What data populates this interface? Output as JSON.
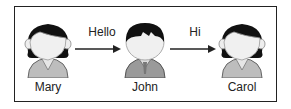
{
  "diagram": {
    "nodes": [
      {
        "id": "mary",
        "label": "Mary",
        "type": "female-person"
      },
      {
        "id": "john",
        "label": "John",
        "type": "male-person"
      },
      {
        "id": "carol",
        "label": "Carol",
        "type": "female-person"
      }
    ],
    "edges": [
      {
        "from": "mary",
        "to": "john",
        "label": "Hello"
      },
      {
        "from": "john",
        "to": "carol",
        "label": "Hi"
      }
    ]
  }
}
